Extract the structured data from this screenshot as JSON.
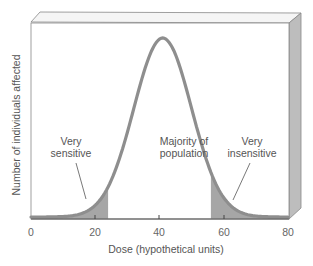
{
  "chart_data": {
    "type": "area",
    "title": "",
    "xlabel": "Dose (hypothetical units)",
    "ylabel": "Number of individuals affected",
    "xlim": [
      0,
      80
    ],
    "x_ticks": [
      0,
      20,
      40,
      60,
      80
    ],
    "x_tick_labels": [
      "0",
      "20",
      "40",
      "60",
      "80"
    ],
    "y_ticks": [],
    "grid": false,
    "legend": null,
    "distribution": {
      "shape": "normal (bell curve)",
      "mean": 41,
      "sd": 9
    },
    "regions": [
      {
        "name": "Very sensitive",
        "x_range": [
          0,
          24
        ],
        "shaded": true
      },
      {
        "name": "Majority of population",
        "x_range": [
          24,
          56
        ],
        "shaded": false
      },
      {
        "name": "Very insensitive",
        "x_range": [
          56,
          80
        ],
        "shaded": true
      }
    ],
    "annotations": [
      {
        "text": "Very sensitive",
        "points_to": "left tail"
      },
      {
        "text": "Majority of population",
        "position": "center"
      },
      {
        "text": "Very insensitive",
        "points_to": "right tail"
      }
    ]
  },
  "labels": {
    "left_1": "Very",
    "left_2": "sensitive",
    "mid_1": "Majority of",
    "mid_2": "population",
    "right_1": "Very",
    "right_2": "insensitive"
  },
  "axes": {
    "xlabel": "Dose (hypothetical units)",
    "ylabel": "Number of individuals affected",
    "ticks": [
      "0",
      "20",
      "40",
      "60",
      "80"
    ]
  },
  "colors": {
    "curve": "#8c8c8c",
    "shade": "#a9a9a9",
    "frame_face": "#ffffff",
    "frame_side": "#b8b8b8",
    "frame_top": "#f2f2f2",
    "frame_line": "#777777"
  }
}
